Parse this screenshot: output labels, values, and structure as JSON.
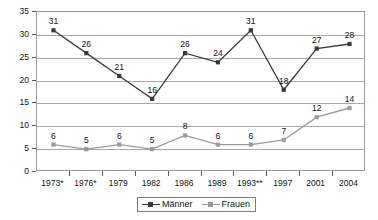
{
  "chart_data": {
    "type": "line",
    "title": "",
    "subtitle": "",
    "xlabel": "",
    "ylabel": "",
    "grid": true,
    "legend_position": "bottom",
    "ylim": [
      0,
      35
    ],
    "ytick_step": 5,
    "yticks": [
      "0",
      "5",
      "10",
      "15",
      "20",
      "25",
      "30",
      "35"
    ],
    "categories": [
      "1973*",
      "1976*",
      "1979",
      "1982",
      "1986",
      "1989",
      "1993**",
      "1997",
      "2001",
      "2004"
    ],
    "series": [
      {
        "name": "Männer",
        "color": "#3a3a3a",
        "marker": "square",
        "values": [
          31,
          26,
          21,
          16,
          26,
          24,
          31,
          18,
          27,
          28
        ],
        "labels": [
          "31",
          "26",
          "21",
          "16",
          "26",
          "24",
          "31",
          "18",
          "27",
          "28"
        ]
      },
      {
        "name": "Frauen",
        "color": "#9b9b9b",
        "marker": "square",
        "values": [
          6,
          5,
          6,
          5,
          8,
          6,
          6,
          7,
          12,
          14
        ],
        "labels": [
          "6",
          "5",
          "6",
          "5",
          "8",
          "6",
          "6",
          "7",
          "12",
          "14"
        ]
      }
    ]
  },
  "legend": {
    "items": [
      {
        "label": "Männer",
        "color": "#3a3a3a"
      },
      {
        "label": "Frauen",
        "color": "#9b9b9b"
      }
    ]
  }
}
